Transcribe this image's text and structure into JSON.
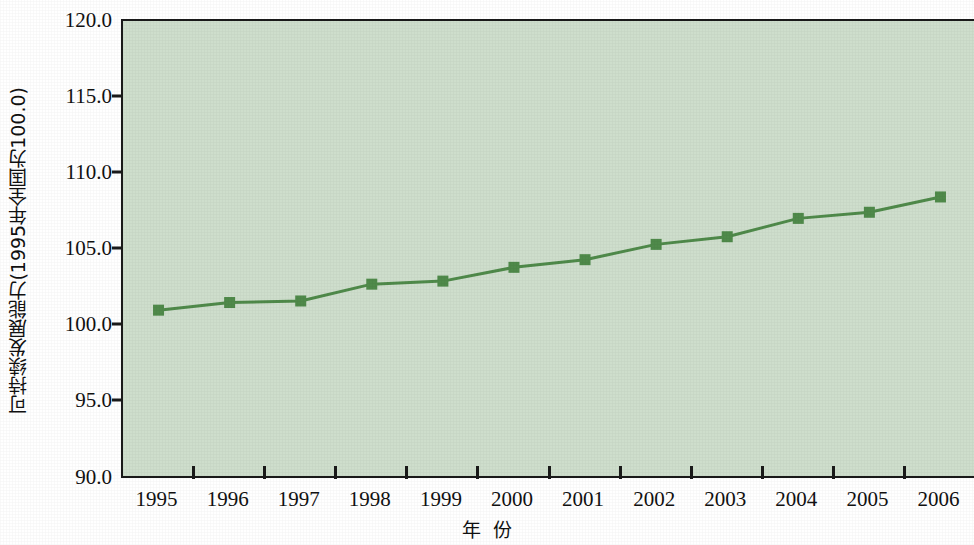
{
  "chart_data": {
    "type": "line",
    "title": "",
    "xlabel": "年 份",
    "ylabel": "可持续发展能力(1995年全国为100.0)",
    "categories": [
      "1995",
      "1996",
      "1997",
      "1998",
      "1999",
      "2000",
      "2001",
      "2002",
      "2003",
      "2004",
      "2005",
      "2006"
    ],
    "values": [
      101.1,
      101.6,
      101.7,
      102.8,
      103.0,
      103.9,
      104.4,
      105.4,
      105.9,
      107.1,
      107.5,
      108.5
    ],
    "series": [
      {
        "name": "可持续发展能力",
        "values": [
          101.1,
          101.6,
          101.7,
          102.8,
          103.0,
          103.9,
          104.4,
          105.4,
          105.9,
          107.1,
          107.5,
          108.5
        ]
      }
    ],
    "ylim": [
      90.0,
      120.0
    ],
    "ytick_labels": [
      "120.0",
      "115.0",
      "110.0",
      "105.0",
      "100.0",
      "95.0",
      "90.0"
    ],
    "ytick_values": [
      120.0,
      115.0,
      110.0,
      105.0,
      100.0,
      95.0,
      90.0
    ],
    "xtick_labels": [
      "1995",
      "1996",
      "1997",
      "1998",
      "1999",
      "2000",
      "2001",
      "2002",
      "2003",
      "2004",
      "2005",
      "2006"
    ],
    "grid": false,
    "legend": "none",
    "colors": {
      "line": "#4f8a4a",
      "marker": "#4f8a4a",
      "plot_background": "#cedecc",
      "axis": "#1a1a1a",
      "text": "#111111",
      "page_background": "#ffffff"
    },
    "marker_style": "square",
    "line_width": 3
  }
}
